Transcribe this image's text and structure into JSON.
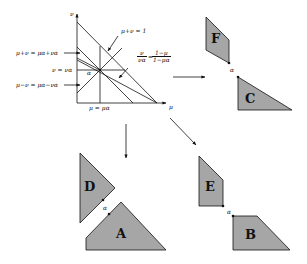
{
  "diagram": {
    "main_plot": {
      "x_axis_label": "μ",
      "y_axis_label": "ν",
      "center_label": "α",
      "annotations": {
        "sum_line": "μ+ν = 1",
        "upper_line": "μ+ν = μα+να",
        "horizontal_line": "ν = να",
        "lower_line": "μ−ν = μα−να",
        "vertical_line": "μ = μα",
        "ratio_line_lhs_num": "ν",
        "ratio_line_lhs_den": "να",
        "ratio_line_eq": "=",
        "ratio_line_rhs_num": "1−μ",
        "ratio_line_rhs_den": "1−μα"
      }
    },
    "groups": [
      {
        "name": "top-right",
        "shapes": [
          "F",
          "C"
        ],
        "alpha": "α"
      },
      {
        "name": "bottom-left",
        "shapes": [
          "D",
          "A"
        ],
        "alpha": "α"
      },
      {
        "name": "bottom-right",
        "shapes": [
          "E",
          "B"
        ],
        "alpha": "α"
      }
    ],
    "shape_labels": {
      "A": "A",
      "B": "B",
      "C": "C",
      "D": "D",
      "E": "E",
      "F": "F"
    },
    "colors": {
      "shape_fill": "#a6a6a6",
      "stroke": "#111111",
      "background": "#ffffff"
    }
  }
}
